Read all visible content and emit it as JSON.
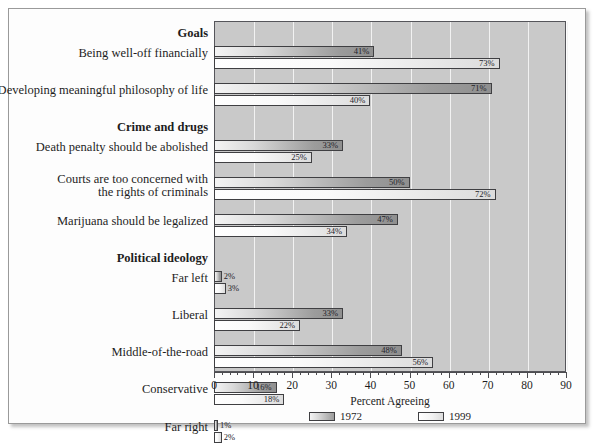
{
  "chart_data": {
    "type": "bar",
    "orientation": "horizontal",
    "title": "",
    "xlabel": "Percent Agreeing",
    "ylabel": "",
    "xlim": [
      0,
      90
    ],
    "xticks": [
      0,
      10,
      20,
      30,
      40,
      50,
      60,
      70,
      80,
      90
    ],
    "minor_tick_step": 2,
    "grid": "vertical white gridlines every 10",
    "legend_position": "bottom-center",
    "value_suffix": "%",
    "series": [
      {
        "name": "1972",
        "values": [
          41,
          71,
          33,
          50,
          47,
          2,
          33,
          48,
          16
        ]
      },
      {
        "name": "1999",
        "values": [
          73,
          40,
          25,
          72,
          34,
          3,
          22,
          56,
          18
        ]
      }
    ],
    "categories": [
      "Being well-off financially",
      "Developing meaningful philosophy of life",
      "Death penalty should be abolished",
      "Courts are too concerned with the rights of criminals",
      "Marijuana should be legalized",
      "Far left",
      "Liberal",
      "Middle-of-the-road",
      "Conservative"
    ],
    "groups": [
      {
        "label": "Goals",
        "categories": [
          "Being well-off financially",
          "Developing meaningful philosophy of life"
        ]
      },
      {
        "label": "Crime and drugs",
        "categories": [
          "Death penalty should be abolished",
          "Courts are too concerned with the rights of criminals",
          "Marijuana should be legalized"
        ]
      },
      {
        "label": "Political ideology",
        "categories": [
          "Far left",
          "Liberal",
          "Middle-of-the-road",
          "Conservative",
          "Far right"
        ]
      }
    ]
  },
  "rows": [
    {
      "kind": "group",
      "label": "Goals"
    },
    {
      "kind": "item",
      "label": "Being well-off financially",
      "v1972": 41,
      "v1999": 73,
      "t1972": "41%",
      "t1999": "73%"
    },
    {
      "kind": "item",
      "label": "Developing meaningful philosophy of life",
      "v1972": 71,
      "v1999": 40,
      "t1972": "71%",
      "t1999": "40%"
    },
    {
      "kind": "group",
      "label": "Crime and drugs"
    },
    {
      "kind": "item",
      "label": "Death penalty should be abolished",
      "v1972": 33,
      "v1999": 25,
      "t1972": "33%",
      "t1999": "25%"
    },
    {
      "kind": "item2",
      "label": "Courts are too concerned with the rights of criminals",
      "line1": "Courts are too concerned with",
      "line2": "the rights of criminals",
      "v1972": 50,
      "v1999": 72,
      "t1972": "50%",
      "t1999": "72%"
    },
    {
      "kind": "item",
      "label": "Marijuana should be legalized",
      "v1972": 47,
      "v1999": 34,
      "t1972": "47%",
      "t1999": "34%"
    },
    {
      "kind": "group",
      "label": "Political ideology"
    },
    {
      "kind": "item",
      "label": "Far left",
      "v1972": 2,
      "v1999": 3,
      "t1972": "2%",
      "t1999": "3%"
    },
    {
      "kind": "item",
      "label": "Liberal",
      "v1972": 33,
      "v1999": 22,
      "t1972": "33%",
      "t1999": "22%"
    },
    {
      "kind": "item",
      "label": "Middle-of-the-road",
      "v1972": 48,
      "v1999": 56,
      "t1972": "48%",
      "t1999": "56%"
    },
    {
      "kind": "item",
      "label": "Conservative",
      "v1972": 16,
      "v1999": 18,
      "t1972": "16%",
      "t1999": "18%"
    },
    {
      "kind": "item",
      "label": "Far right",
      "v1972": 1,
      "v1999": 2,
      "t1972": "1%",
      "t1999": "2%"
    }
  ],
  "axis": {
    "xlabel": "Percent Agreeing",
    "ticks": [
      "0",
      "10",
      "20",
      "30",
      "40",
      "50",
      "60",
      "70",
      "80",
      "90"
    ]
  },
  "legend": {
    "items": [
      {
        "label": "1972",
        "series": "s1972"
      },
      {
        "label": "1999",
        "series": "s1999"
      }
    ]
  },
  "colors": {
    "plot_background": "#c9c9c9",
    "gridline": "#f2f2f2",
    "bar_outline": "#3f3f42",
    "axis": "#4c4c50",
    "text": "#1d1d1d",
    "page_background": "#fdfdfd",
    "frame_border": "#9a9a9a"
  }
}
